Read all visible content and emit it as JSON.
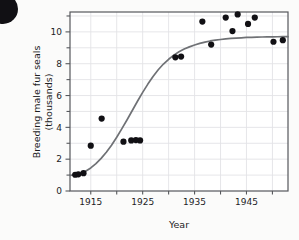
{
  "figure": {
    "clipped_header_text": "",
    "corner_marker": "black-circle-bullet"
  },
  "chart_data": {
    "type": "scatter",
    "title": "",
    "xlabel": "Year",
    "ylabel": "Breeding male fur seals (thousands)",
    "ylabel_line1": "Breeding male fur seals",
    "ylabel_line2": "(thousands)",
    "xlim": [
      1911,
      1953
    ],
    "ylim": [
      0,
      11.25
    ],
    "xticks": [
      1915,
      1925,
      1935,
      1945
    ],
    "xtick_labels": [
      "1915",
      "1925",
      "1935",
      "1945"
    ],
    "xminor_ticks": [
      1920,
      1930,
      1940,
      1950
    ],
    "yticks": [
      0,
      2,
      4,
      6,
      8,
      10
    ],
    "ytick_labels": [
      "0",
      "2",
      "4",
      "6",
      "8",
      "10"
    ],
    "yminor_ticks": [
      1,
      3,
      5,
      7,
      9,
      11
    ],
    "grid": true,
    "grid_color": "#e3e3e6",
    "legend": null,
    "marker_color": "#111014",
    "marker_size_px": 3.1,
    "points": [
      {
        "x": 1912.0,
        "y": 1.02
      },
      {
        "x": 1912.6,
        "y": 1.05
      },
      {
        "x": 1913.6,
        "y": 1.12
      },
      {
        "x": 1915.0,
        "y": 2.85
      },
      {
        "x": 1917.1,
        "y": 4.55
      },
      {
        "x": 1921.3,
        "y": 3.1
      },
      {
        "x": 1922.8,
        "y": 3.18
      },
      {
        "x": 1923.7,
        "y": 3.2
      },
      {
        "x": 1924.5,
        "y": 3.18
      },
      {
        "x": 1931.3,
        "y": 8.4
      },
      {
        "x": 1932.4,
        "y": 8.45
      },
      {
        "x": 1936.5,
        "y": 10.65
      },
      {
        "x": 1938.2,
        "y": 9.2
      },
      {
        "x": 1941.0,
        "y": 10.9
      },
      {
        "x": 1942.3,
        "y": 10.05
      },
      {
        "x": 1943.3,
        "y": 11.1
      },
      {
        "x": 1945.3,
        "y": 10.5
      },
      {
        "x": 1946.6,
        "y": 10.9
      },
      {
        "x": 1950.2,
        "y": 9.38
      },
      {
        "x": 1952.0,
        "y": 9.48
      }
    ],
    "fitted_curve": {
      "name": "logistic-fit",
      "color": "#6f7175",
      "width_px": 1.7,
      "asymptote": 9.7,
      "points": [
        {
          "x": 1911.0,
          "y": 0.98
        },
        {
          "x": 1912.0,
          "y": 1.02
        },
        {
          "x": 1913.0,
          "y": 1.1
        },
        {
          "x": 1914.0,
          "y": 1.24
        },
        {
          "x": 1915.0,
          "y": 1.45
        },
        {
          "x": 1916.0,
          "y": 1.72
        },
        {
          "x": 1917.0,
          "y": 2.05
        },
        {
          "x": 1918.0,
          "y": 2.44
        },
        {
          "x": 1919.0,
          "y": 2.88
        },
        {
          "x": 1920.0,
          "y": 3.38
        },
        {
          "x": 1921.0,
          "y": 3.92
        },
        {
          "x": 1922.0,
          "y": 4.48
        },
        {
          "x": 1923.0,
          "y": 5.06
        },
        {
          "x": 1924.0,
          "y": 5.64
        },
        {
          "x": 1925.0,
          "y": 6.2
        },
        {
          "x": 1926.0,
          "y": 6.72
        },
        {
          "x": 1927.0,
          "y": 7.2
        },
        {
          "x": 1928.0,
          "y": 7.62
        },
        {
          "x": 1929.0,
          "y": 7.98
        },
        {
          "x": 1930.0,
          "y": 8.28
        },
        {
          "x": 1931.0,
          "y": 8.54
        },
        {
          "x": 1932.0,
          "y": 8.75
        },
        {
          "x": 1933.0,
          "y": 8.92
        },
        {
          "x": 1934.0,
          "y": 9.06
        },
        {
          "x": 1935.0,
          "y": 9.18
        },
        {
          "x": 1936.0,
          "y": 9.28
        },
        {
          "x": 1937.0,
          "y": 9.36
        },
        {
          "x": 1938.0,
          "y": 9.43
        },
        {
          "x": 1939.0,
          "y": 9.48
        },
        {
          "x": 1940.0,
          "y": 9.52
        },
        {
          "x": 1941.0,
          "y": 9.56
        },
        {
          "x": 1942.0,
          "y": 9.59
        },
        {
          "x": 1943.0,
          "y": 9.61
        },
        {
          "x": 1944.0,
          "y": 9.63
        },
        {
          "x": 1945.0,
          "y": 9.65
        },
        {
          "x": 1946.0,
          "y": 9.66
        },
        {
          "x": 1947.0,
          "y": 9.67
        },
        {
          "x": 1948.0,
          "y": 9.68
        },
        {
          "x": 1949.0,
          "y": 9.685
        },
        {
          "x": 1950.0,
          "y": 9.69
        },
        {
          "x": 1951.0,
          "y": 9.695
        },
        {
          "x": 1952.0,
          "y": 9.7
        },
        {
          "x": 1953.0,
          "y": 9.7
        }
      ]
    }
  }
}
